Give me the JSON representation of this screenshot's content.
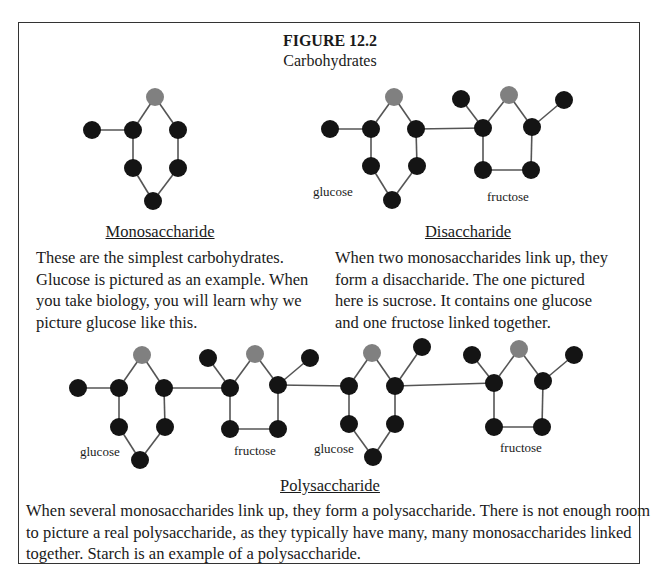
{
  "figure": {
    "title": "FIGURE 12.2",
    "subtitle": "Carbohydrates"
  },
  "colors": {
    "node_dark": "#141414",
    "node_gray": "#808080",
    "bond": "#555555",
    "border": "#333333"
  },
  "sections": {
    "monosaccharide": {
      "heading": "Monosaccharide",
      "lines": [
        "These are the simplest carbohydrates.",
        "Glucose is pictured as an example.  When",
        "you take biology, you will learn why we",
        "picture glucose like this."
      ]
    },
    "disaccharide": {
      "heading": "Disaccharide",
      "lines": [
        "When two monosaccharides link up, they",
        "form a disaccharide.  The one pictured",
        "here is sucrose.  It contains one glucose",
        "and one fructose linked together."
      ],
      "labels": [
        "glucose",
        "fructose"
      ]
    },
    "polysaccharide": {
      "heading": "Polysaccharide",
      "lines": [
        "When several monosaccharides link up, they form a polysaccharide.  There is not enough room",
        "to picture a real polysaccharide, as they typically have many, many monosaccharides linked",
        "together.  Starch is an example of a polysaccharide."
      ],
      "labels": [
        "glucose",
        "fructose",
        "glucose",
        "fructose"
      ]
    }
  },
  "molecules": {
    "nodes": [
      {
        "x": 92,
        "y": 130,
        "c": "d"
      },
      {
        "x": 133,
        "y": 130,
        "c": "d"
      },
      {
        "x": 155,
        "y": 97,
        "c": "g"
      },
      {
        "x": 178,
        "y": 130,
        "c": "d"
      },
      {
        "x": 133,
        "y": 168,
        "c": "d"
      },
      {
        "x": 178,
        "y": 168,
        "c": "d"
      },
      {
        "x": 153,
        "y": 201,
        "c": "d"
      },
      {
        "x": 330,
        "y": 129,
        "c": "d"
      },
      {
        "x": 371,
        "y": 129,
        "c": "d"
      },
      {
        "x": 394,
        "y": 97,
        "c": "g"
      },
      {
        "x": 416,
        "y": 129,
        "c": "d"
      },
      {
        "x": 371,
        "y": 166,
        "c": "d"
      },
      {
        "x": 417,
        "y": 166,
        "c": "d"
      },
      {
        "x": 392,
        "y": 200,
        "c": "d"
      },
      {
        "x": 461,
        "y": 99,
        "c": "d"
      },
      {
        "x": 483,
        "y": 128,
        "c": "d"
      },
      {
        "x": 509,
        "y": 95,
        "c": "g"
      },
      {
        "x": 532,
        "y": 127,
        "c": "d"
      },
      {
        "x": 564,
        "y": 100,
        "c": "d"
      },
      {
        "x": 483,
        "y": 170,
        "c": "d"
      },
      {
        "x": 531,
        "y": 170,
        "c": "d"
      },
      {
        "x": 78,
        "y": 388,
        "c": "d"
      },
      {
        "x": 119,
        "y": 388,
        "c": "d"
      },
      {
        "x": 142,
        "y": 355,
        "c": "g"
      },
      {
        "x": 164,
        "y": 388,
        "c": "d"
      },
      {
        "x": 119,
        "y": 427,
        "c": "d"
      },
      {
        "x": 165,
        "y": 427,
        "c": "d"
      },
      {
        "x": 140,
        "y": 460,
        "c": "d"
      },
      {
        "x": 208,
        "y": 358,
        "c": "d"
      },
      {
        "x": 230,
        "y": 388,
        "c": "d"
      },
      {
        "x": 255,
        "y": 354,
        "c": "g"
      },
      {
        "x": 278,
        "y": 385,
        "c": "d"
      },
      {
        "x": 310,
        "y": 358,
        "c": "d"
      },
      {
        "x": 230,
        "y": 429,
        "c": "d"
      },
      {
        "x": 278,
        "y": 429,
        "c": "d"
      },
      {
        "x": 349,
        "y": 386,
        "c": "d"
      },
      {
        "x": 372,
        "y": 353,
        "c": "g"
      },
      {
        "x": 395,
        "y": 386,
        "c": "d"
      },
      {
        "x": 422,
        "y": 347,
        "c": "d"
      },
      {
        "x": 349,
        "y": 424,
        "c": "d"
      },
      {
        "x": 395,
        "y": 424,
        "c": "d"
      },
      {
        "x": 373,
        "y": 457,
        "c": "d"
      },
      {
        "x": 472,
        "y": 355,
        "c": "d"
      },
      {
        "x": 494,
        "y": 383,
        "c": "d"
      },
      {
        "x": 519,
        "y": 349,
        "c": "g"
      },
      {
        "x": 543,
        "y": 381,
        "c": "d"
      },
      {
        "x": 574,
        "y": 355,
        "c": "d"
      },
      {
        "x": 494,
        "y": 427,
        "c": "d"
      },
      {
        "x": 542,
        "y": 427,
        "c": "d"
      }
    ],
    "bonds": [
      [
        0,
        1
      ],
      [
        1,
        2
      ],
      [
        2,
        3
      ],
      [
        1,
        4
      ],
      [
        3,
        5
      ],
      [
        4,
        6
      ],
      [
        5,
        6
      ],
      [
        7,
        8
      ],
      [
        8,
        9
      ],
      [
        9,
        10
      ],
      [
        8,
        11
      ],
      [
        10,
        12
      ],
      [
        11,
        13
      ],
      [
        12,
        13
      ],
      [
        10,
        15
      ],
      [
        14,
        15
      ],
      [
        15,
        16
      ],
      [
        16,
        17
      ],
      [
        17,
        18
      ],
      [
        15,
        19
      ],
      [
        17,
        20
      ],
      [
        19,
        20
      ],
      [
        21,
        22
      ],
      [
        22,
        23
      ],
      [
        23,
        24
      ],
      [
        22,
        25
      ],
      [
        24,
        26
      ],
      [
        25,
        27
      ],
      [
        26,
        27
      ],
      [
        24,
        29
      ],
      [
        28,
        29
      ],
      [
        29,
        30
      ],
      [
        30,
        31
      ],
      [
        31,
        32
      ],
      [
        29,
        33
      ],
      [
        31,
        34
      ],
      [
        33,
        34
      ],
      [
        31,
        35
      ],
      [
        35,
        36
      ],
      [
        36,
        37
      ],
      [
        37,
        38
      ],
      [
        35,
        39
      ],
      [
        37,
        40
      ],
      [
        39,
        41
      ],
      [
        40,
        41
      ],
      [
        37,
        43
      ],
      [
        42,
        43
      ],
      [
        43,
        44
      ],
      [
        44,
        45
      ],
      [
        45,
        46
      ],
      [
        43,
        47
      ],
      [
        45,
        48
      ],
      [
        47,
        48
      ]
    ]
  }
}
